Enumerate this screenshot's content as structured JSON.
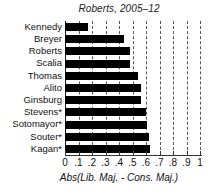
{
  "chart_data": {
    "type": "bar",
    "orientation": "horizontal",
    "title": "Roberts, 2005–12",
    "xlabel": "Abs(Lib. Maj. - Cons. Maj.)",
    "ylabel": "",
    "categories": [
      "Kennedy",
      "Breyer",
      "Roberts",
      "Scalia",
      "Thomas",
      "Alito",
      "Ginsburg",
      "Stevens*",
      "Sotomayor*",
      "Souter*",
      "Kagan*"
    ],
    "values": [
      0.17,
      0.44,
      0.48,
      0.48,
      0.54,
      0.56,
      0.56,
      0.6,
      0.61,
      0.62,
      0.63
    ],
    "xlim": [
      0,
      1
    ],
    "xticks": [
      0,
      0.1,
      0.2,
      0.3,
      0.4,
      0.5,
      0.6,
      0.7,
      0.8,
      0.9,
      1
    ],
    "xticklabels": [
      "0",
      ".1",
      ".2",
      ".3",
      ".4",
      ".5",
      ".6",
      ".7",
      ".8",
      ".9",
      "1"
    ],
    "grid": "vertical-dashed",
    "legend": null,
    "bar_color": "#000000",
    "grid_color": "#555555",
    "axis_color": "#333333"
  }
}
